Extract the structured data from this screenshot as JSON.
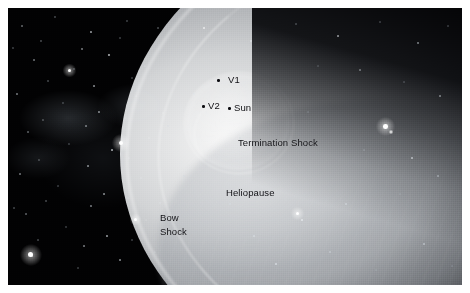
{
  "figure": {
    "background_color": "#020203",
    "plate_border_color": "#ffffff"
  },
  "annotations": {
    "v1": {
      "label": "V1",
      "marker": "voyager-1-position-dot"
    },
    "v2": {
      "label": "V2",
      "marker": "voyager-2-position-dot"
    },
    "sun": {
      "label": "Sun",
      "marker": "sun-position-dot"
    },
    "termination_shock": {
      "label": "Termination Shock"
    },
    "heliopause": {
      "label": "Heliopause"
    },
    "bow_shock": {
      "label_line1": "Bow",
      "label_line2": "Shock"
    }
  },
  "colors": {
    "label_text": "#101014",
    "marker": "#0d0d11",
    "heliosphere_bright": "#fcfcfc",
    "deep_space": "#020203"
  }
}
